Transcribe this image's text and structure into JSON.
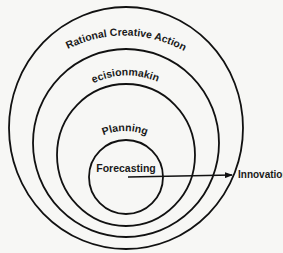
{
  "diagram": {
    "type": "nested-circles",
    "circles": [
      {
        "label": "Rational Creative Action",
        "cx": 126,
        "cy": 128,
        "rx": 117,
        "ry": 121
      },
      {
        "label": "Decisionmaking",
        "cx": 126,
        "cy": 143,
        "rx": 93,
        "ry": 94
      },
      {
        "label": "Planning",
        "cx": 126,
        "cy": 155,
        "rx": 69,
        "ry": 71
      },
      {
        "label": "Forecasting",
        "cx": 126,
        "cy": 177,
        "rx": 37,
        "ry": 37
      }
    ],
    "arrow": {
      "label": "Innovation"
    },
    "colors": {
      "line": "#111111",
      "background": "#f7f7f5"
    }
  }
}
